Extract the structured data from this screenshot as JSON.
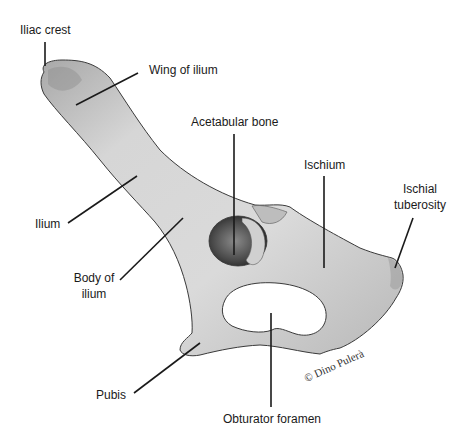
{
  "figure": {
    "colors": {
      "background": "#ffffff",
      "bone_fill": "#d4d4d4",
      "bone_shadow": "#9a9a9a",
      "outline": "#3a3a3a",
      "leader_line": "#1a1a1a",
      "label_text": "#1a1a1a"
    }
  },
  "labels": {
    "iliac_crest": "Iliac crest",
    "wing_of_ilium": "Wing of ilium",
    "acetabular_bone": "Acetabular bone",
    "ischium": "Ischium",
    "ischial_tuberosity_line1": "Ischial",
    "ischial_tuberosity_line2": "tuberosity",
    "ilium": "Ilium",
    "body_of_ilium_line1": "Body of",
    "body_of_ilium_line2": "ilium",
    "pubis": "Pubis",
    "obturator_foramen": "Obturator foramen"
  },
  "credit": "© Dino Pulerà"
}
